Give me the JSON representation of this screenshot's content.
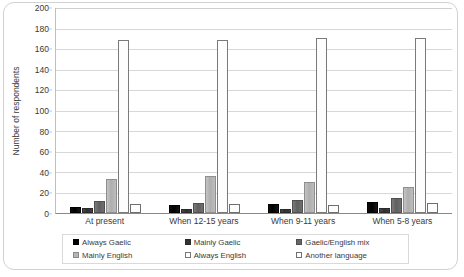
{
  "chart_data": {
    "type": "bar",
    "title": "",
    "xlabel": "",
    "ylabel": "Number of respondents",
    "ylim": [
      0,
      200
    ],
    "ytick_step": 20,
    "yticks": [
      0,
      20,
      40,
      60,
      80,
      100,
      120,
      140,
      160,
      180,
      200
    ],
    "grid": true,
    "legend_position": "bottom",
    "legend_columns": 3,
    "categories": [
      "At present",
      "When 12-15 years",
      "When 9-11 years",
      "When 5-8 years"
    ],
    "series": [
      {
        "name": "Always Gaelic",
        "color": "#000000",
        "values": [
          6,
          8,
          9,
          11
        ]
      },
      {
        "name": "Mainly Gaelic",
        "color": "#333333",
        "values": [
          5,
          4,
          4,
          5
        ]
      },
      {
        "name": "Gaelic/English mix",
        "color": "#666666",
        "values": [
          12,
          10,
          13,
          15
        ]
      },
      {
        "name": "Mainly English",
        "color": "#b6b6b6",
        "values": [
          33,
          36,
          30,
          25
        ]
      },
      {
        "name": "Always English",
        "color": "#ffffff",
        "values": [
          169,
          169,
          171,
          171
        ]
      },
      {
        "name": "Another language",
        "color": "#ffffff",
        "values": [
          9,
          9,
          8,
          10
        ]
      }
    ]
  }
}
